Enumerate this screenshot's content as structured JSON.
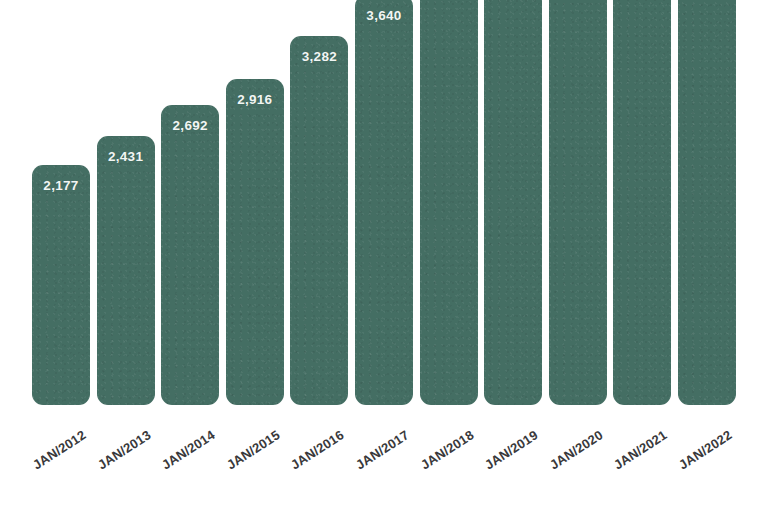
{
  "chart_data": {
    "type": "bar",
    "title": "",
    "subtitle": "",
    "xlabel": "",
    "ylabel": "",
    "grid": false,
    "legend": null,
    "axis_visible": false,
    "value_labels_shown": true,
    "bar_color": "#446e63",
    "value_label_color": "#ffffff",
    "tick_label_color": "#39393b",
    "background_color": "#ffffff",
    "ylim": [
      0,
      5200
    ],
    "categories": [
      "JAN/2012",
      "JAN/2013",
      "JAN/2014",
      "JAN/2015",
      "JAN/2016",
      "JAN/2017",
      "JAN/2018",
      "JAN/2019",
      "JAN/2020",
      "JAN/2021",
      "JAN/2022"
    ],
    "values": [
      2177,
      2431,
      2692,
      2916,
      3282,
      3640,
      3950,
      4212,
      4418,
      4758,
      4950
    ],
    "value_labels": [
      "2,177",
      "2,431",
      "2,692",
      "2,916",
      "3,282",
      "3,640",
      "3,950",
      "4,212",
      "4,418",
      "4,758",
      "4,950"
    ]
  },
  "layout": {
    "baseline_y": 405,
    "plot_height": 508,
    "first_bar_left": 32,
    "bar_width": 58,
    "bar_pitch": 64.6,
    "px_per_unit": 0.1166,
    "value_offset": 120,
    "label_inset": 13
  }
}
